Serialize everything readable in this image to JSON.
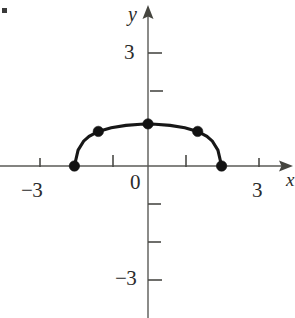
{
  "figure": {
    "title": "",
    "corner_artifact": "bullet-mark"
  },
  "labels": {
    "y_axis_name": "y",
    "x_axis_name": "x",
    "origin": "0",
    "y_top": "3",
    "y_bottom": "−3",
    "x_left": "−3",
    "x_right": "3"
  },
  "colors": {
    "axis": "#5a5a56",
    "curve": "#171717",
    "point": "#121212",
    "background": "#ffffff",
    "text": "#2b2b2b"
  },
  "chart_data": {
    "type": "line",
    "title": "",
    "xlabel": "x",
    "ylabel": "y",
    "xlim": [
      -3.9,
      3.9
    ],
    "ylim": [
      -3.9,
      3.9
    ],
    "grid": false,
    "legend": null,
    "x_ticks": [
      -3,
      -2,
      -1,
      0,
      1,
      2,
      3
    ],
    "x_tick_labels": [
      "−3",
      "",
      "",
      "0",
      "",
      "",
      "3"
    ],
    "y_ticks": [
      -3,
      -2,
      -1,
      0,
      1,
      2,
      3
    ],
    "y_tick_labels": [
      "−3",
      "",
      "",
      "",
      "",
      "",
      "3"
    ],
    "series": [
      {
        "name": "arc",
        "description": "semicircular arc from (-2,0) to (2,0) peaking near (0,1.1)",
        "x": [
          -2.0,
          -1.9,
          -1.75,
          -1.6,
          -1.35,
          -1.0,
          -0.6,
          -0.2,
          0.0,
          0.2,
          0.6,
          1.0,
          1.35,
          1.6,
          1.75,
          1.9,
          2.0
        ],
        "y": [
          0.0,
          0.42,
          0.66,
          0.79,
          0.92,
          1.02,
          1.08,
          1.11,
          1.12,
          1.11,
          1.08,
          1.02,
          0.92,
          0.79,
          0.66,
          0.42,
          0.0
        ]
      }
    ],
    "points": [
      {
        "label": "",
        "x": -2.0,
        "y": 0.0
      },
      {
        "label": "",
        "x": -1.35,
        "y": 0.92
      },
      {
        "label": "",
        "x": 0.0,
        "y": 1.12
      },
      {
        "label": "",
        "x": 1.35,
        "y": 0.92
      },
      {
        "label": "",
        "x": 2.0,
        "y": 0.0
      }
    ]
  }
}
